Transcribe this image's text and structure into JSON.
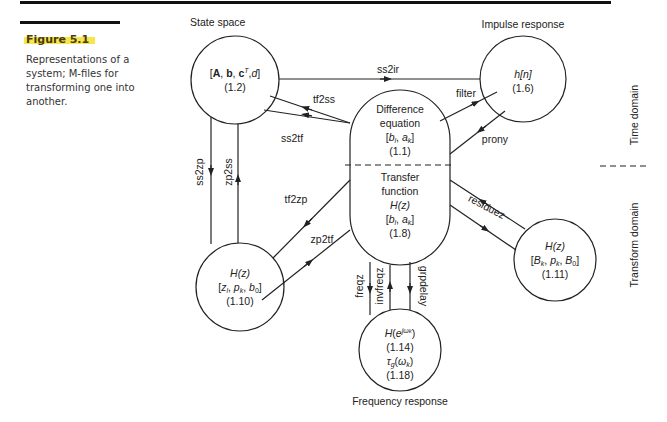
{
  "figure": {
    "label": "Figure 5.1",
    "caption": "Representations of a system; M-files for transforming one into another.",
    "highlight_color": "#f6e64a"
  },
  "domains": {
    "time": "Time domain",
    "transform": "Transform domain"
  },
  "nodes": {
    "state_space": {
      "title": "State space",
      "line1": "[A, b, cT, d]",
      "eq": "(1.2)"
    },
    "impulse": {
      "title": "Impulse response",
      "line1": "h[n]",
      "eq": "(1.6)"
    },
    "difference": {
      "line1": "Difference",
      "line2": "equation",
      "line3": "[bl, ak]",
      "eq": "(1.1)"
    },
    "transfer": {
      "line1": "Transfer",
      "line2": "function",
      "line3": "H(z)",
      "line4": "[bl, ak]",
      "eq": "(1.8)"
    },
    "zpk": {
      "line1": "H(z)",
      "line2": "[zl, pk, b0]",
      "eq": "(1.10)"
    },
    "residue": {
      "line1": "H(z)",
      "line2": "[Bk, pk, B0]",
      "eq": "(1.11)"
    },
    "frequency": {
      "title": "Frequency response",
      "line1": "H(e^jωk)",
      "eq1": "(1.14)",
      "line2": "τg(ωk)",
      "eq2": "(1.18)"
    }
  },
  "edges": [
    {
      "label": "ss2ir",
      "from": "state_space",
      "to": "impulse"
    },
    {
      "label": "tf2ss",
      "from": "difference",
      "to": "state_space"
    },
    {
      "label": "ss2tf",
      "from": "state_space",
      "to": "difference"
    },
    {
      "label": "filter",
      "from": "difference",
      "to": "impulse"
    },
    {
      "label": "prony",
      "from": "impulse",
      "to": "difference"
    },
    {
      "label": "ss2zp",
      "from": "state_space",
      "to": "zpk"
    },
    {
      "label": "zp2ss",
      "from": "zpk",
      "to": "state_space"
    },
    {
      "label": "tf2zp",
      "from": "transfer",
      "to": "zpk"
    },
    {
      "label": "zp2tf",
      "from": "zpk",
      "to": "transfer"
    },
    {
      "label": "residuez",
      "from": "transfer",
      "to": "residue"
    },
    {
      "label": "freqz",
      "from": "transfer",
      "to": "frequency"
    },
    {
      "label": "invfreqz",
      "from": "frequency",
      "to": "transfer"
    },
    {
      "label": "grpdelay",
      "from": "transfer",
      "to": "frequency"
    }
  ]
}
